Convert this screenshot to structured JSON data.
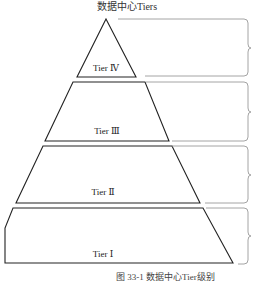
{
  "title": "数据中心Tiers",
  "tiers": [
    {
      "label": "Tier Ⅳ",
      "level": 4
    },
    {
      "label": "Tier Ⅲ",
      "level": 3
    },
    {
      "label": "Tier Ⅱ",
      "level": 2
    },
    {
      "label": "Tier Ⅰ",
      "level": 1
    }
  ],
  "caption": "图 33-1  数据中心Tier级别",
  "colors": {
    "outline": "#222222",
    "brace": "#9a9a9a",
    "background": "#ffffff"
  }
}
